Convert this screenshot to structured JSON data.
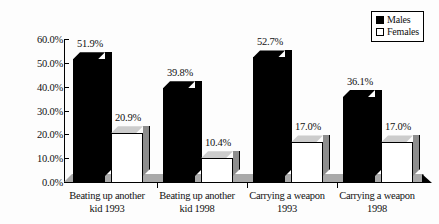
{
  "chart_data": {
    "type": "bar",
    "title": "",
    "subtitle": "",
    "xlabel": "",
    "ylabel": "",
    "ylim": [
      0,
      60
    ],
    "grid": false,
    "legend_position": "top-right",
    "categories": [
      "Beating up another kid 1993",
      "Beating up another kid 1998",
      "Carrying a weapon 1993",
      "Carrying a weapon 1998"
    ],
    "category_lines": [
      [
        "Beating up another",
        "kid 1993"
      ],
      [
        "Beating up another",
        "kid 1998"
      ],
      [
        "Carrying a weapon",
        "1993"
      ],
      [
        "Carrying a weapon",
        "1998"
      ]
    ],
    "series": [
      {
        "name": "Males",
        "color": "#000000",
        "values": [
          51.9,
          39.8,
          52.7,
          36.1
        ],
        "labels": [
          "51.9%",
          "39.8%",
          "52.7%",
          "36.1%"
        ]
      },
      {
        "name": "Females",
        "color": "#ffffff",
        "values": [
          20.9,
          10.4,
          17.0,
          17.0
        ],
        "labels": [
          "20.9%",
          "10.4%",
          "17.0%",
          "17.0%"
        ]
      }
    ],
    "y_ticks": [
      0,
      10,
      20,
      30,
      40,
      50,
      60
    ],
    "y_tick_labels": [
      "0.0%",
      "10.0%",
      "20.0%",
      "30.0%",
      "40.0%",
      "50.0%",
      "60.0%"
    ]
  },
  "legend": {
    "items": [
      {
        "label": "Males",
        "swatch": "filled-square-icon"
      },
      {
        "label": "Females",
        "swatch": "hollow-square-icon"
      }
    ]
  }
}
